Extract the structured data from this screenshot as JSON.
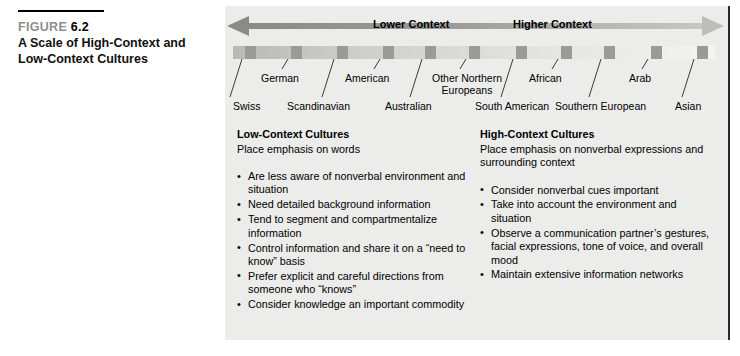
{
  "caption": {
    "figure_word": "FIGURE",
    "figure_number": "6.2",
    "title_line1": "A Scale of High-Context and",
    "title_line2": "Low-Context Cultures"
  },
  "axis": {
    "left_label": "Lower Context",
    "right_label": "Higher Context",
    "left_arrow_icon": "arrow-left-icon",
    "right_arrow_icon": "arrow-right-icon"
  },
  "scale": {
    "cultures": [
      {
        "name": "Swiss",
        "row": "lower",
        "tick_x": 12,
        "label_x": 8
      },
      {
        "name": "German",
        "row": "upper",
        "tick_x": 58,
        "label_x": 36
      },
      {
        "name": "Scandinavian",
        "row": "lower",
        "tick_x": 104,
        "label_x": 62
      },
      {
        "name": "American",
        "row": "upper",
        "tick_x": 150,
        "label_x": 120
      },
      {
        "name": "Australian",
        "row": "lower",
        "tick_x": 192,
        "label_x": 160
      },
      {
        "name": "Other Northern Europeans",
        "row": "upper",
        "tick_x": 236,
        "label_x": 204
      },
      {
        "name": "South American",
        "row": "lower",
        "tick_x": 283,
        "label_x": 250
      },
      {
        "name": "African",
        "row": "upper",
        "tick_x": 328,
        "label_x": 304
      },
      {
        "name": "Southern European",
        "row": "lower",
        "tick_x": 371,
        "label_x": 330
      },
      {
        "name": "Arab",
        "row": "upper",
        "tick_x": 418,
        "label_x": 404
      },
      {
        "name": "Asian",
        "row": "lower",
        "tick_x": 464,
        "label_x": 450
      }
    ]
  },
  "columns": [
    {
      "heading": "Low-Context Cultures",
      "subhead": "Place emphasis on words",
      "bullets": [
        "Are less aware of nonverbal environment and situation",
        "Need detailed background information",
        "Tend to segment and compartmentalize information",
        "Control information and share it on a “need to know” basis",
        "Prefer explicit and careful directions from someone who “knows”",
        "Consider knowledge an important commodity"
      ]
    },
    {
      "heading": "High-Context Cultures",
      "subhead": "Place emphasis on nonverbal expressions and surrounding context",
      "bullets": [
        "Consider nonverbal cues important",
        "Take into account the environment and situation",
        "Observe a communication partner’s gestures, facial expressions, tone of voice, and overall mood",
        "Maintain extensive information networks"
      ]
    }
  ],
  "colors": {
    "panel_background": "#ececeb",
    "arrow_dark": "#8a8a88",
    "arrow_light": "#b8b8b6",
    "tick": "#9a9a98",
    "figure_word": "#8d8d8d",
    "border": "#2a2a2a"
  }
}
